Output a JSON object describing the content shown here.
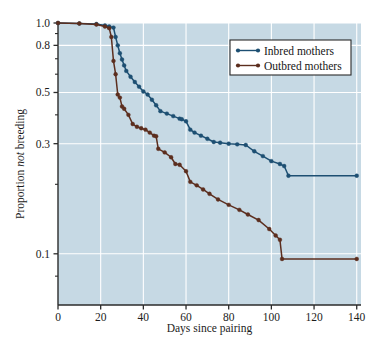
{
  "chart_data": {
    "type": "line",
    "title": "",
    "xlabel": "Days since pairing",
    "ylabel_parts": [
      "Proportion ",
      "not",
      " breeding"
    ],
    "ylabel": "Proportion not breeding",
    "xlim": [
      0,
      142
    ],
    "ylim": [
      0.06,
      1.0
    ],
    "yscale": "log",
    "xticks": [
      0,
      20,
      40,
      60,
      80,
      100,
      120,
      140
    ],
    "xtick_labels": [
      "0",
      "20",
      "40",
      "60",
      "80",
      "100",
      "120",
      "140"
    ],
    "yticks": [
      1.0,
      0.8,
      0.5,
      0.3,
      0.1
    ],
    "ytick_labels": [
      "1.0",
      "0.8",
      "0.5",
      "0.3",
      "0.1"
    ],
    "yminorticks": [
      0.9,
      0.7,
      0.6,
      0.4,
      0.2,
      0.08
    ],
    "grid": true,
    "grid_color": "#ffffff",
    "plot_background": "#c6d9e4",
    "legend_position": "upper-right",
    "series": [
      {
        "name": "Inbred mothers",
        "color": "#1d4f72",
        "marker": "circle",
        "points": [
          [
            0,
            1.0
          ],
          [
            10,
            0.995
          ],
          [
            18,
            0.99
          ],
          [
            22,
            0.975
          ],
          [
            24,
            0.965
          ],
          [
            26,
            0.955
          ],
          [
            27,
            0.87
          ],
          [
            28,
            0.8
          ],
          [
            29,
            0.74
          ],
          [
            30,
            0.695
          ],
          [
            31,
            0.655
          ],
          [
            32,
            0.62
          ],
          [
            34,
            0.585
          ],
          [
            36,
            0.555
          ],
          [
            38,
            0.53
          ],
          [
            40,
            0.505
          ],
          [
            42,
            0.49
          ],
          [
            44,
            0.465
          ],
          [
            46,
            0.44
          ],
          [
            48,
            0.415
          ],
          [
            51,
            0.405
          ],
          [
            54,
            0.395
          ],
          [
            57,
            0.385
          ],
          [
            58,
            0.383
          ],
          [
            60,
            0.375
          ],
          [
            62,
            0.345
          ],
          [
            64,
            0.335
          ],
          [
            67,
            0.325
          ],
          [
            70,
            0.315
          ],
          [
            73,
            0.305
          ],
          [
            76,
            0.303
          ],
          [
            80,
            0.3
          ],
          [
            84,
            0.298
          ],
          [
            88,
            0.296
          ],
          [
            92,
            0.278
          ],
          [
            96,
            0.265
          ],
          [
            100,
            0.252
          ],
          [
            104,
            0.245
          ],
          [
            106,
            0.24
          ],
          [
            108,
            0.218
          ],
          [
            140,
            0.218
          ]
        ]
      },
      {
        "name": "Outbred mothers",
        "color": "#5c2e1e",
        "marker": "circle",
        "points": [
          [
            0,
            1.0
          ],
          [
            10,
            0.995
          ],
          [
            18,
            0.985
          ],
          [
            22,
            0.965
          ],
          [
            24,
            0.95
          ],
          [
            25,
            0.87
          ],
          [
            26,
            0.685
          ],
          [
            27,
            0.6
          ],
          [
            28,
            0.49
          ],
          [
            29,
            0.475
          ],
          [
            30,
            0.435
          ],
          [
            31,
            0.425
          ],
          [
            33,
            0.4
          ],
          [
            35,
            0.365
          ],
          [
            37,
            0.355
          ],
          [
            39,
            0.35
          ],
          [
            41,
            0.345
          ],
          [
            43,
            0.335
          ],
          [
            45,
            0.325
          ],
          [
            46,
            0.323
          ],
          [
            47,
            0.285
          ],
          [
            50,
            0.275
          ],
          [
            53,
            0.262
          ],
          [
            55,
            0.245
          ],
          [
            57,
            0.243
          ],
          [
            60,
            0.228
          ],
          [
            62,
            0.205
          ],
          [
            65,
            0.198
          ],
          [
            68,
            0.19
          ],
          [
            71,
            0.182
          ],
          [
            75,
            0.172
          ],
          [
            80,
            0.163
          ],
          [
            85,
            0.155
          ],
          [
            89,
            0.148
          ],
          [
            94,
            0.14
          ],
          [
            99,
            0.128
          ],
          [
            102,
            0.12
          ],
          [
            104,
            0.115
          ],
          [
            105,
            0.095
          ],
          [
            140,
            0.095
          ]
        ]
      }
    ]
  },
  "legend": {
    "items": [
      {
        "label": "Inbred mothers",
        "color": "#1d4f72"
      },
      {
        "label": "Outbred mothers",
        "color": "#5c2e1e"
      }
    ]
  },
  "axes": {
    "x_title": "Days since pairing",
    "y_title_prefix": "Proportion ",
    "y_title_emphasis": "not",
    "y_title_suffix": " breeding"
  }
}
